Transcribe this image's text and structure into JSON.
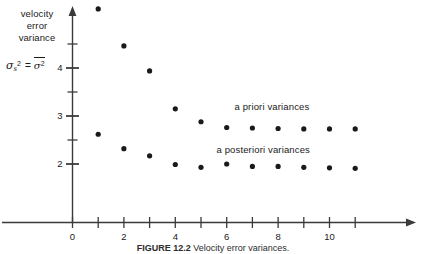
{
  "axis_caption": {
    "lines": [
      "velocity",
      "error",
      "variance"
    ]
  },
  "formula": {
    "symbol": "σ",
    "subscript": "s",
    "superscript": "2",
    "equals": "=",
    "rhs_symbol": "σ",
    "rhs_superscript": "2",
    "plain": "σₛ² = σ̅²"
  },
  "figure_caption": {
    "number": "FIGURE 12.2",
    "text": "Velocity error variances."
  },
  "chart_data": {
    "type": "scatter",
    "title": "",
    "xlabel": "",
    "ylabel": "velocity error variance",
    "xlim": [
      0,
      11.8
    ],
    "ylim": [
      1.62,
      5.45
    ],
    "xticks": [
      0,
      1,
      2,
      3,
      4,
      5,
      6,
      7,
      8,
      9,
      10,
      11
    ],
    "xticklabels": [
      "0",
      "",
      "2",
      "",
      "4",
      "",
      "6",
      "",
      "8",
      "",
      "10",
      ""
    ],
    "xticklabels_shown": [
      "0",
      "2",
      "4",
      "6",
      "8",
      "10"
    ],
    "yticks": [
      2,
      2.5,
      3,
      3.5,
      4,
      4.5
    ],
    "yticklabels_shown": [
      "2",
      "3",
      "4"
    ],
    "grid": false,
    "legend": "annotations",
    "marker": "filled-circle",
    "marker_color": "#1a1a1a",
    "axis_color": "#3a3a3a",
    "series": [
      {
        "name": "a priori variances",
        "label_x": 6.3,
        "label_y": 3.18,
        "x": [
          1,
          2,
          3,
          4,
          5,
          6,
          7,
          8,
          9,
          10,
          11
        ],
        "values": [
          5.23,
          4.46,
          3.94,
          3.15,
          2.88,
          2.76,
          2.75,
          2.74,
          2.73,
          2.73,
          2.73
        ]
      },
      {
        "name": "a posteriori variances",
        "label_x": 5.6,
        "label_y": 2.3,
        "x": [
          1,
          2,
          3,
          4,
          5,
          6,
          7,
          8,
          9,
          10,
          11
        ],
        "values": [
          2.62,
          2.32,
          2.17,
          1.99,
          1.93,
          2.0,
          1.95,
          1.95,
          1.93,
          1.92,
          1.91
        ]
      }
    ]
  }
}
